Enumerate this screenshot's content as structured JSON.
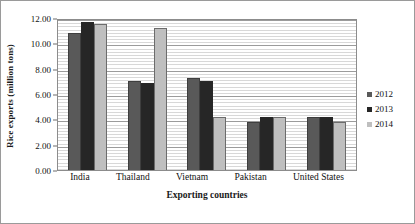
{
  "chart_data": {
    "type": "bar",
    "title": "",
    "xlabel": "Exporting countries",
    "ylabel": "Rice exports (million tons)",
    "categories": [
      "India",
      "Thailand",
      "Vietnam",
      "Pakistan",
      "United States"
    ],
    "series": [
      {
        "name": "2012",
        "color": "#595959",
        "values": [
          10.8,
          7.0,
          7.3,
          3.8,
          4.2
        ]
      },
      {
        "name": "2013",
        "color": "#262626",
        "values": [
          11.7,
          6.9,
          7.0,
          4.2,
          4.2
        ]
      },
      {
        "name": "2014",
        "color": "#bfbfbf",
        "values": [
          11.5,
          11.2,
          4.2,
          4.2,
          3.8
        ]
      }
    ],
    "ylim": [
      0,
      12
    ],
    "ytick_labels": [
      "0.00",
      "2.00",
      "4.00",
      "6.00",
      "8.00",
      "10.00",
      "12.00"
    ],
    "ytick_values": [
      0,
      2,
      4,
      6,
      8,
      10,
      12
    ],
    "grid": true,
    "minor_grid": true,
    "legend_position": "right"
  }
}
